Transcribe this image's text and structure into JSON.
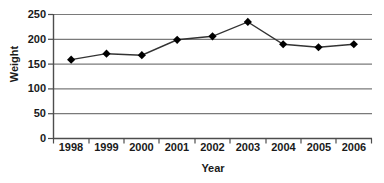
{
  "chart_data": {
    "type": "line",
    "title": "",
    "xlabel": "Year",
    "ylabel": "Weight",
    "categories": [
      "1998",
      "1999",
      "2000",
      "2001",
      "2002",
      "2003",
      "2004",
      "2005",
      "2006"
    ],
    "values": [
      159,
      171,
      168,
      199,
      206,
      235,
      190,
      184,
      190
    ],
    "series": [
      {
        "name": "Weight",
        "values": [
          159,
          171,
          168,
          199,
          206,
          235,
          190,
          184,
          190
        ]
      }
    ],
    "ylim": [
      0,
      250
    ],
    "yticks": [
      "0",
      "50",
      "100",
      "150",
      "200",
      "250"
    ],
    "ytick_values": [
      0,
      50,
      100,
      150,
      200,
      250
    ],
    "xlim": [
      "1998",
      "2006"
    ],
    "grid": "horizontal",
    "legend": "none",
    "marker": "diamond",
    "line_color": "#333333",
    "marker_color": "#000000",
    "grid_color": "#808080",
    "axis_color": "#595959",
    "background": "#ffffff"
  },
  "axes": {
    "y_label": "Weight",
    "x_label": "Year",
    "y_ticks": [
      {
        "label": "250",
        "value": 250
      },
      {
        "label": "200",
        "value": 200
      },
      {
        "label": "150",
        "value": 150
      },
      {
        "label": "100",
        "value": 100
      },
      {
        "label": "50",
        "value": 50
      },
      {
        "label": "0",
        "value": 0
      }
    ],
    "x_ticks": [
      {
        "label": "1998"
      },
      {
        "label": "1999"
      },
      {
        "label": "2000"
      },
      {
        "label": "2001"
      },
      {
        "label": "2002"
      },
      {
        "label": "2003"
      },
      {
        "label": "2004"
      },
      {
        "label": "2005"
      },
      {
        "label": "2006"
      }
    ]
  }
}
